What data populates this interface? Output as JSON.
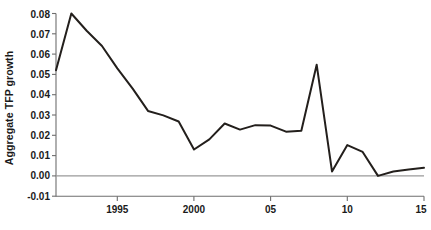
{
  "chart_data": {
    "type": "line",
    "title": "",
    "subtitle": "",
    "xlabel": "",
    "ylabel": "Aggregate TFP growth",
    "x": [
      1991,
      1992,
      1993,
      1994,
      1995,
      1996,
      1997,
      1998,
      1999,
      2000,
      2001,
      2002,
      2003,
      2004,
      2005,
      2006,
      2007,
      2008,
      2009,
      2010,
      2011,
      2012,
      2013,
      2014,
      2015
    ],
    "values": [
      0.052,
      0.08,
      0.072,
      0.064,
      0.053,
      0.043,
      0.032,
      0.03,
      0.027,
      0.013,
      0.018,
      0.026,
      0.023,
      0.025,
      0.025,
      0.022,
      0.022,
      0.055,
      0.002,
      0.015,
      0.012,
      0.0,
      0.002,
      0.003,
      0.004
    ],
    "series": [
      {
        "name": "Aggregate TFP growth",
        "values": [
          0.052,
          0.08,
          0.072,
          0.064,
          0.053,
          0.043,
          0.032,
          0.03,
          0.027,
          0.013,
          0.018,
          0.026,
          0.023,
          0.025,
          0.025,
          0.022,
          0.022,
          0.055,
          0.002,
          0.015,
          0.012,
          0.0,
          0.002,
          0.003,
          0.004
        ]
      }
    ],
    "points": [
      {
        "x": 1991,
        "y": 0.052
      },
      {
        "x": 1992,
        "y": 0.08
      },
      {
        "x": 1993,
        "y": 0.0715
      },
      {
        "x": 1994,
        "y": 0.064
      },
      {
        "x": 1995,
        "y": 0.053
      },
      {
        "x": 1996,
        "y": 0.043
      },
      {
        "x": 1997,
        "y": 0.032
      },
      {
        "x": 1998,
        "y": 0.0298
      },
      {
        "x": 1999,
        "y": 0.0268
      },
      {
        "x": 2000,
        "y": 0.013
      },
      {
        "x": 2001,
        "y": 0.018
      },
      {
        "x": 2002,
        "y": 0.0258
      },
      {
        "x": 2003,
        "y": 0.0228
      },
      {
        "x": 2004,
        "y": 0.025
      },
      {
        "x": 2005,
        "y": 0.0248
      },
      {
        "x": 2006,
        "y": 0.0218
      },
      {
        "x": 2007,
        "y": 0.0222
      },
      {
        "x": 2008,
        "y": 0.0548
      },
      {
        "x": 2009,
        "y": 0.0022
      },
      {
        "x": 2010,
        "y": 0.0152
      },
      {
        "x": 2011,
        "y": 0.0118
      },
      {
        "x": 2012,
        "y": 0.0
      },
      {
        "x": 2013,
        "y": 0.0022
      },
      {
        "x": 2014,
        "y": 0.0032
      },
      {
        "x": 2015,
        "y": 0.004
      }
    ],
    "xlim": [
      1991,
      2015
    ],
    "ylim": [
      -0.01,
      0.08
    ],
    "ytick_values": [
      0.08,
      0.07,
      0.06,
      0.05,
      0.04,
      0.03,
      0.02,
      0.01,
      0.0,
      -0.01
    ],
    "ytick_labels": [
      "0.08",
      "0.07",
      "0.06",
      "0.05",
      "0.04",
      "0.03",
      "0.02",
      "0.01",
      "0.00",
      "-0.01"
    ],
    "xtick_values": [
      1995,
      2000,
      2005,
      2010,
      2015
    ],
    "xtick_labels": [
      "1995",
      "2000",
      "05",
      "10",
      "15"
    ],
    "grid": false,
    "legend": false,
    "legend_position": "none",
    "zero_line": true,
    "annotations": [],
    "colors": {
      "line": "#231f1c",
      "axis": "#6e6e6e",
      "zero_line": "#9a9a9a",
      "text": "#1a1a1a",
      "background": "#ffffff"
    }
  }
}
